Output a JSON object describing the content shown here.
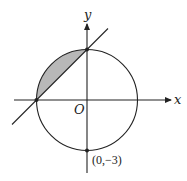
{
  "diagram": {
    "type": "coordinate-geometry",
    "axes": {
      "x_label": "x",
      "y_label": "y",
      "origin_label": "O"
    },
    "circle": {
      "center": [
        0,
        0
      ],
      "radius": 3
    },
    "line": {
      "equation": "y = x + 3",
      "slope": 1,
      "intercepts": [
        [
          -3,
          0
        ],
        [
          0,
          3
        ]
      ]
    },
    "points": [
      {
        "label": "(0,−3)",
        "coords": [
          0,
          -3
        ]
      }
    ],
    "shaded_region": "segment of circle between chord from (-3,0) to (0,3) and the arc in the second quadrant",
    "colors": {
      "stroke": "#222222",
      "shade": "#b8b8b8",
      "background": "#ffffff"
    }
  }
}
